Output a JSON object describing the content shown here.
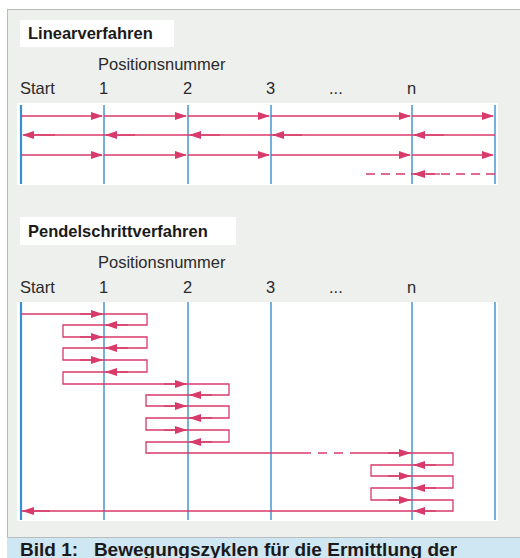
{
  "colors": {
    "panel_bg": "#eef0ee",
    "canvas_bg": "#ffffff",
    "axis_line": "#3a8fd0",
    "path_line": "#d83a6a",
    "caption_bg": "#cfe6f3"
  },
  "sections": [
    {
      "title": "Linearverfahren",
      "axis_title": "Positionsnummer",
      "position_labels": [
        "Start",
        "1",
        "2",
        "3",
        "...",
        "n"
      ]
    },
    {
      "title": "Pendelschrittverfahren",
      "axis_title": "Positionsnummer",
      "position_labels": [
        "Start",
        "1",
        "2",
        "3",
        "...",
        "n"
      ]
    }
  ],
  "caption": {
    "text": "Bild 1:   Bewegungszyklen für die Ermittlung der"
  }
}
